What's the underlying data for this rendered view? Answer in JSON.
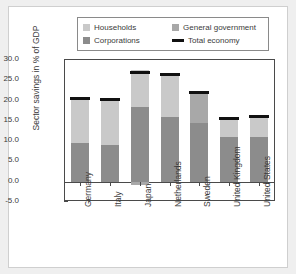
{
  "chart_data": {
    "type": "bar",
    "subtype": "stacked-bar-with-marker",
    "title": "",
    "xlabel": "",
    "ylabel": "Sector savings in % of GDP",
    "ylim": [
      -5.0,
      30.0
    ],
    "yticks": [
      "30.0",
      "25.0",
      "20.0",
      "15.0",
      "10.0",
      "5.0",
      "0.0",
      "-5.0"
    ],
    "ytick_values": [
      30.0,
      25.0,
      20.0,
      15.0,
      10.0,
      5.0,
      0.0,
      -5.0
    ],
    "grid": false,
    "legend_position": "top",
    "categories": [
      "Germany",
      "Italy",
      "Japan",
      "Netherlands",
      "Sweden",
      "United Kingdom",
      "United States"
    ],
    "series": [
      {
        "name": "Corporations",
        "color": "#8c8c8c",
        "values": [
          9.5,
          9.0,
          18.5,
          16.0,
          14.5,
          11.0,
          11.0
        ]
      },
      {
        "name": "Households",
        "color": "#c9c9c9",
        "values": [
          10.8,
          11.2,
          9.1,
          10.5,
          0.0,
          4.5,
          5.0
        ]
      },
      {
        "name": "General government",
        "color": "#a8a8a8",
        "values": [
          0.0,
          0.0,
          -0.8,
          0.0,
          7.5,
          0.0,
          0.0
        ]
      }
    ],
    "markers": {
      "name": "Total economy",
      "color": "#111111",
      "values": [
        20.5,
        20.3,
        26.8,
        26.5,
        22.0,
        15.5,
        16.0
      ]
    }
  },
  "legend": {
    "items": [
      {
        "label": "Households",
        "swatch": "#c9c9c9",
        "type": "box"
      },
      {
        "label": "General government",
        "swatch": "#a8a8a8",
        "type": "box"
      },
      {
        "label": "Corporations",
        "swatch": "#8c8c8c",
        "type": "box"
      },
      {
        "label": "Total economy",
        "swatch": "#111111",
        "type": "line"
      }
    ]
  }
}
